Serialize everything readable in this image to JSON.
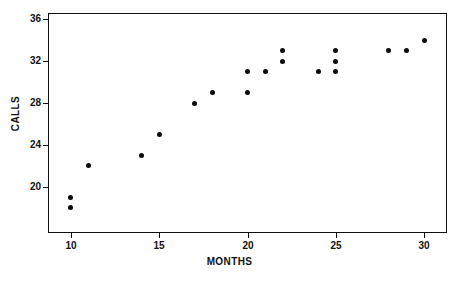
{
  "chart_data": {
    "type": "scatter",
    "title": "",
    "xlabel": "MONTHS",
    "ylabel": "CALLS",
    "xlim": [
      8.7,
      31.3
    ],
    "ylim": [
      15.6,
      36.6
    ],
    "grid": false,
    "legend": "none",
    "xticks": [
      10,
      15,
      20,
      25,
      30
    ],
    "xtick_labels": [
      "10",
      "15",
      "20",
      "25",
      "30"
    ],
    "yticks": [
      20,
      24,
      28,
      32,
      36
    ],
    "ytick_labels": [
      "20",
      "24",
      "28",
      "32",
      "36"
    ],
    "marker": "filled-circle",
    "marker_color": "#0a0a0a",
    "points": [
      {
        "x": 10,
        "y": 19
      },
      {
        "x": 10,
        "y": 18
      },
      {
        "x": 11,
        "y": 22
      },
      {
        "x": 14,
        "y": 23
      },
      {
        "x": 15,
        "y": 25
      },
      {
        "x": 17,
        "y": 28
      },
      {
        "x": 18,
        "y": 29
      },
      {
        "x": 20,
        "y": 29
      },
      {
        "x": 20,
        "y": 31
      },
      {
        "x": 21,
        "y": 31
      },
      {
        "x": 22,
        "y": 33
      },
      {
        "x": 22,
        "y": 32
      },
      {
        "x": 24,
        "y": 31
      },
      {
        "x": 25,
        "y": 33
      },
      {
        "x": 25,
        "y": 32
      },
      {
        "x": 25,
        "y": 31
      },
      {
        "x": 28,
        "y": 33
      },
      {
        "x": 29,
        "y": 33
      },
      {
        "x": 30,
        "y": 34
      }
    ]
  },
  "axes": {
    "x_title": "MONTHS",
    "y_title": "CALLS"
  }
}
